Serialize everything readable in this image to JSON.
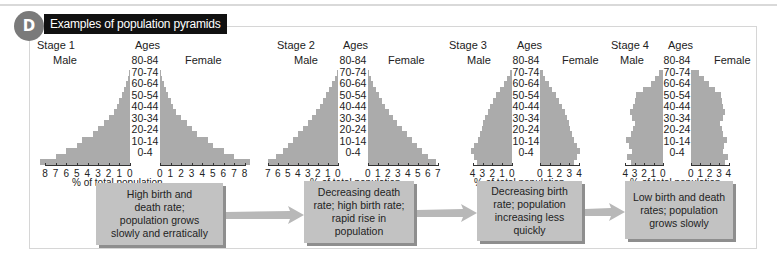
{
  "header": {
    "badge_letter": "D",
    "title": "Examples of population pyramids"
  },
  "labels": {
    "ages": "Ages",
    "male": "Male",
    "female": "Female",
    "xlabel": "% of total population"
  },
  "age_groups": [
    "80-84",
    "70-74",
    "60-64",
    "50-54",
    "40-44",
    "30-34",
    "20-24",
    "10-14",
    "0-4"
  ],
  "stages": [
    {
      "name": "Stage 1",
      "description": "High birth and death rate; population grows slowly and erratically",
      "desc_lines": [
        "High birth and",
        "death rate;",
        "population grows",
        "slowly and erratically"
      ],
      "male_ticks": [
        "8",
        "7",
        "6",
        "5",
        "4",
        "3",
        "2",
        "1",
        "0"
      ],
      "female_ticks": [
        "0",
        "1",
        "2",
        "3",
        "4",
        "5",
        "6",
        "7",
        "8"
      ]
    },
    {
      "name": "Stage 2",
      "description": "Decreasing death rate; high birth rate; rapid rise in population",
      "desc_lines": [
        "Decreasing death",
        "rate; high birth rate;",
        "rapid rise in",
        "population"
      ],
      "male_ticks": [
        "7",
        "6",
        "5",
        "4",
        "3",
        "2",
        "1",
        "0"
      ],
      "female_ticks": [
        "0",
        "1",
        "2",
        "3",
        "4",
        "5",
        "6",
        "7"
      ]
    },
    {
      "name": "Stage 3",
      "description": "Decreasing birth rate; population increasing less quickly",
      "desc_lines": [
        "Decreasing birth",
        "rate; population",
        "increasing less",
        "quickly"
      ],
      "male_ticks": [
        "4",
        "3",
        "2",
        "1",
        "0"
      ],
      "female_ticks": [
        "0",
        "1",
        "2",
        "3",
        "4"
      ]
    },
    {
      "name": "Stage 4",
      "description": "Low birth and death rates; population grows slowly",
      "desc_lines": [
        "Low birth and death",
        "rates; population",
        "grows slowly"
      ],
      "male_ticks": [
        "4",
        "3",
        "2",
        "1",
        "0"
      ],
      "female_ticks": [
        "0",
        "1",
        "2",
        "3",
        "4"
      ]
    }
  ],
  "colors": {
    "bar": "#ababab",
    "box": "#c2c2c2",
    "box_shadow": "#8e8e8e",
    "arrow": "#b8b8b8",
    "badge": "#7a7a7a",
    "title_bg": "#111111"
  },
  "chart_data": [
    {
      "type": "bar",
      "title": "Stage 1",
      "orientation": "horizontal-pyramid",
      "categories": [
        "0-4",
        "5-9",
        "10-14",
        "15-19",
        "20-24",
        "25-29",
        "30-34",
        "35-39",
        "40-44",
        "45-49",
        "50-54",
        "55-59",
        "60-64",
        "65-69",
        "70-74",
        "75-79",
        "80-84"
      ],
      "series": [
        {
          "name": "Male",
          "values": [
            8.5,
            7.0,
            6.0,
            5.0,
            4.5,
            3.5,
            3.0,
            2.5,
            2.0,
            1.5,
            1.2,
            1.0,
            0.8,
            0.6,
            0.4,
            0.2,
            0.1
          ]
        },
        {
          "name": "Female",
          "values": [
            8.5,
            7.0,
            6.0,
            5.0,
            4.5,
            3.5,
            3.0,
            2.5,
            2.0,
            1.5,
            1.2,
            1.0,
            0.8,
            0.6,
            0.4,
            0.2,
            0.1
          ]
        }
      ],
      "xlabel": "% of total population",
      "ylabel": "Ages",
      "xlim": [
        0,
        8
      ]
    },
    {
      "type": "bar",
      "title": "Stage 2",
      "orientation": "horizontal-pyramid",
      "categories": [
        "0-4",
        "5-9",
        "10-14",
        "15-19",
        "20-24",
        "25-29",
        "30-34",
        "35-39",
        "40-44",
        "45-49",
        "50-54",
        "55-59",
        "60-64",
        "65-69",
        "70-74",
        "75-79",
        "80-84"
      ],
      "series": [
        {
          "name": "Male",
          "values": [
            7.0,
            6.2,
            5.5,
            5.0,
            4.5,
            4.0,
            3.5,
            3.0,
            2.6,
            2.2,
            1.8,
            1.5,
            1.2,
            0.9,
            0.6,
            0.3,
            0.1
          ]
        },
        {
          "name": "Female",
          "values": [
            6.8,
            6.0,
            5.4,
            4.9,
            4.4,
            3.9,
            3.4,
            2.9,
            2.5,
            2.1,
            1.7,
            1.4,
            1.1,
            0.8,
            0.5,
            0.3,
            0.1
          ]
        }
      ],
      "xlabel": "% of total population",
      "ylabel": "Ages",
      "xlim": [
        0,
        7
      ]
    },
    {
      "type": "bar",
      "title": "Stage 3",
      "orientation": "horizontal-pyramid",
      "categories": [
        "0-4",
        "5-9",
        "10-14",
        "15-19",
        "20-24",
        "25-29",
        "30-34",
        "35-39",
        "40-44",
        "45-49",
        "50-54",
        "55-59",
        "60-64",
        "65-69",
        "70-74",
        "75-79",
        "80-84"
      ],
      "series": [
        {
          "name": "Male",
          "values": [
            3.6,
            3.9,
            4.2,
            3.9,
            3.5,
            3.3,
            3.1,
            3.0,
            2.8,
            2.5,
            2.2,
            1.9,
            1.6,
            1.2,
            0.8,
            0.5,
            0.2
          ]
        },
        {
          "name": "Female",
          "values": [
            3.5,
            3.8,
            4.1,
            3.8,
            3.5,
            3.3,
            3.1,
            3.0,
            2.8,
            2.5,
            2.2,
            1.9,
            1.6,
            1.2,
            0.9,
            0.5,
            0.3
          ]
        }
      ],
      "xlabel": "% of total population",
      "ylabel": "Ages",
      "xlim": [
        0,
        4
      ]
    },
    {
      "type": "bar",
      "title": "Stage 4",
      "orientation": "horizontal-pyramid",
      "categories": [
        "0-4",
        "5-9",
        "10-14",
        "15-19",
        "20-24",
        "25-29",
        "30-34",
        "35-39",
        "40-44",
        "45-49",
        "50-54",
        "55-59",
        "60-64",
        "65-69",
        "70-74",
        "75-79",
        "80-84"
      ],
      "series": [
        {
          "name": "Male",
          "values": [
            3.4,
            3.8,
            3.3,
            3.6,
            3.9,
            3.4,
            3.2,
            3.0,
            3.3,
            3.5,
            3.2,
            3.0,
            2.9,
            2.1,
            1.3,
            0.8,
            0.4
          ]
        },
        {
          "name": "Female",
          "values": [
            3.6,
            3.9,
            3.4,
            3.5,
            3.8,
            3.4,
            3.3,
            3.1,
            3.4,
            3.6,
            3.4,
            3.3,
            3.2,
            2.6,
            1.9,
            1.4,
            0.9
          ]
        }
      ],
      "xlabel": "% of total population",
      "ylabel": "Ages",
      "xlim": [
        0,
        4
      ]
    }
  ]
}
